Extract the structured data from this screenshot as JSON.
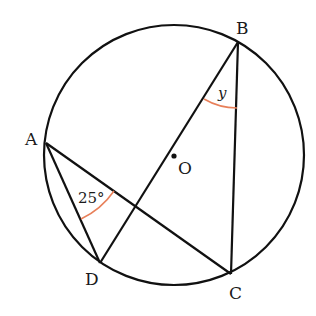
{
  "diagram": {
    "type": "circle-geometry",
    "circle": {
      "center_label": "O",
      "cx": 174,
      "cy": 155,
      "r": 130
    },
    "points": {
      "A": {
        "label": "A",
        "x": 46,
        "y": 143
      },
      "B": {
        "label": "B",
        "x": 238,
        "y": 42
      },
      "C": {
        "label": "C",
        "x": 231,
        "y": 274
      },
      "D": {
        "label": "D",
        "x": 100,
        "y": 263
      },
      "O": {
        "label": "O",
        "x": 174,
        "y": 156
      }
    },
    "segments": [
      "A-D",
      "A-C",
      "B-D",
      "B-C"
    ],
    "angles": {
      "DAC": {
        "label": "25°",
        "vertex": "A"
      },
      "DBC": {
        "label": "y",
        "vertex": "B"
      }
    },
    "colors": {
      "line": "#111111",
      "angle_arc": "#e8805a"
    }
  }
}
